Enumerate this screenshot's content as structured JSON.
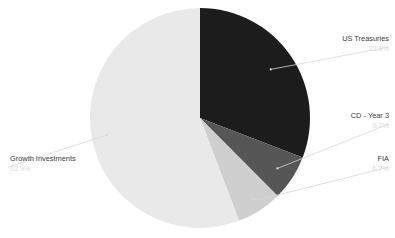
{
  "chart_data": {
    "type": "pie",
    "title": "",
    "subtitle": "",
    "xlabel": "",
    "ylabel": "",
    "legend_position": "callout-labels",
    "grid": false,
    "start_angle_deg": 0,
    "direction": "clockwise",
    "center": {
      "x": 200,
      "y": 118
    },
    "radius": 110,
    "categories": [
      "US Treasuries",
      "CD - Year 3",
      "FIA",
      "Growth Investments"
    ],
    "values": [
      22.8,
      6.7,
      6.7,
      63.9
    ],
    "value_unit": "%",
    "colors": [
      "#1c1c1c",
      "#565656",
      "#cfcfcf",
      "#e9e9e9"
    ],
    "slices": [
      {
        "label": "US Treasuries",
        "value": 22.8,
        "value_text": "22.8%",
        "color": "#1c1c1c",
        "start_angle_deg": 0,
        "end_angle_deg": 111.0,
        "callout_side": "right"
      },
      {
        "label": "CD - Year 3",
        "value": 6.7,
        "value_text": "6.7%",
        "color": "#565656",
        "start_angle_deg": 111.0,
        "end_angle_deg": 135.1,
        "callout_side": "right"
      },
      {
        "label": "FIA",
        "value": 6.7,
        "value_text": "6.7%",
        "color": "#cfcfcf",
        "start_angle_deg": 135.1,
        "end_angle_deg": 159.2,
        "callout_side": "right"
      },
      {
        "label": "Growth Investments",
        "value": 63.9,
        "value_text": "63.9%",
        "color": "#e9e9e9",
        "start_angle_deg": 159.2,
        "end_angle_deg": 360.0,
        "callout_side": "left"
      }
    ]
  },
  "callouts": {
    "us_treasuries": {
      "name": "US Treasuries",
      "value": "22.8%"
    },
    "cd_year_3": {
      "name": "CD - Year 3",
      "value": "6.7%"
    },
    "fia": {
      "name": "FIA",
      "value": "6.7%"
    },
    "growth_investments": {
      "name": "Growth Investments",
      "value": "63.9%"
    }
  },
  "style": {
    "background": "#ffffff",
    "label_color": "#3c3c3c",
    "value_color": "#dcdcdc",
    "leader_color": "#d7d7d7"
  }
}
